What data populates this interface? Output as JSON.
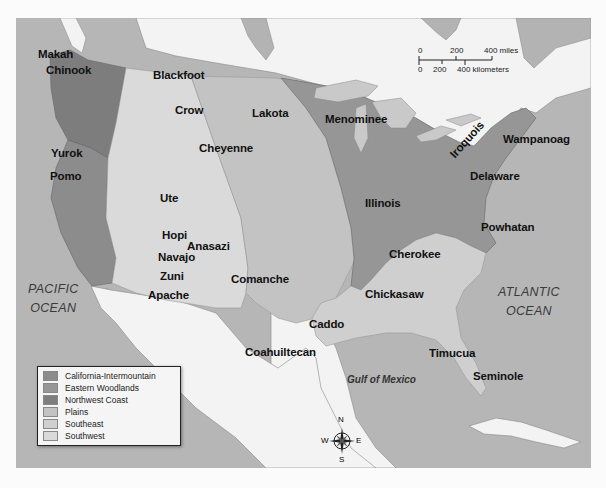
{
  "map": {
    "type": "thematic-map",
    "subject": "Native American culture regions of North America",
    "regions": [
      {
        "name": "California-Intermountain",
        "color": "#8c8c8c"
      },
      {
        "name": "Eastern Woodlands",
        "color": "#969696"
      },
      {
        "name": "Northwest Coast",
        "color": "#7d7d7d"
      },
      {
        "name": "Plains",
        "color": "#c3c3c3"
      },
      {
        "name": "Southeast",
        "color": "#cfcfcf"
      },
      {
        "name": "Southwest",
        "color": "#dadada"
      }
    ]
  },
  "legend": {
    "items": [
      {
        "label": "California-Intermountain",
        "color": "#8c8c8c"
      },
      {
        "label": "Eastern Woodlands",
        "color": "#969696"
      },
      {
        "label": "Northwest Coast",
        "color": "#7d7d7d"
      },
      {
        "label": "Plains",
        "color": "#c3c3c3"
      },
      {
        "label": "Southeast",
        "color": "#cfcfcf"
      },
      {
        "label": "Southwest",
        "color": "#dadada"
      }
    ]
  },
  "scale_bar": {
    "miles": {
      "ticks": [
        "0",
        "200",
        "400 miles"
      ]
    },
    "kilometers": {
      "ticks": [
        "0",
        "200",
        "400 kilometers"
      ]
    }
  },
  "compass": {
    "n": "N",
    "s": "S",
    "e": "E",
    "w": "W"
  },
  "water_labels": {
    "pacific": "PACIFIC\nOCEAN",
    "pacific_line1": "PACIFIC",
    "pacific_line2": "OCEAN",
    "atlantic_line1": "ATLANTIC",
    "atlantic_line2": "OCEAN",
    "gulf": "Gulf of Mexico"
  },
  "tribes": [
    {
      "name": "Makah",
      "x": 38,
      "y": 48
    },
    {
      "name": "Chinook",
      "x": 46,
      "y": 64
    },
    {
      "name": "Blackfoot",
      "x": 153,
      "y": 69
    },
    {
      "name": "Crow",
      "x": 175,
      "y": 104
    },
    {
      "name": "Lakota",
      "x": 252,
      "y": 107
    },
    {
      "name": "Menominee",
      "x": 325,
      "y": 113
    },
    {
      "name": "Wampanoag",
      "x": 503,
      "y": 133
    },
    {
      "name": "Iroquois",
      "x": 460,
      "y": 145
    },
    {
      "name": "Yurok",
      "x": 51,
      "y": 147
    },
    {
      "name": "Cheyenne",
      "x": 199,
      "y": 142
    },
    {
      "name": "Delaware",
      "x": 470,
      "y": 170
    },
    {
      "name": "Pomo",
      "x": 50,
      "y": 170
    },
    {
      "name": "Ute",
      "x": 160,
      "y": 192
    },
    {
      "name": "Illinois",
      "x": 365,
      "y": 197
    },
    {
      "name": "Powhatan",
      "x": 481,
      "y": 221
    },
    {
      "name": "Hopi",
      "x": 162,
      "y": 229
    },
    {
      "name": "Anasazi",
      "x": 187,
      "y": 240
    },
    {
      "name": "Navajo",
      "x": 158,
      "y": 251
    },
    {
      "name": "Cherokee",
      "x": 389,
      "y": 248
    },
    {
      "name": "Zuni",
      "x": 160,
      "y": 270
    },
    {
      "name": "Comanche",
      "x": 231,
      "y": 273
    },
    {
      "name": "Chickasaw",
      "x": 365,
      "y": 288
    },
    {
      "name": "Apache",
      "x": 148,
      "y": 289
    },
    {
      "name": "Caddo",
      "x": 309,
      "y": 318
    },
    {
      "name": "Coahuiltecan",
      "x": 245,
      "y": 346
    },
    {
      "name": "Timucua",
      "x": 429,
      "y": 347
    },
    {
      "name": "Seminole",
      "x": 473,
      "y": 370
    }
  ]
}
